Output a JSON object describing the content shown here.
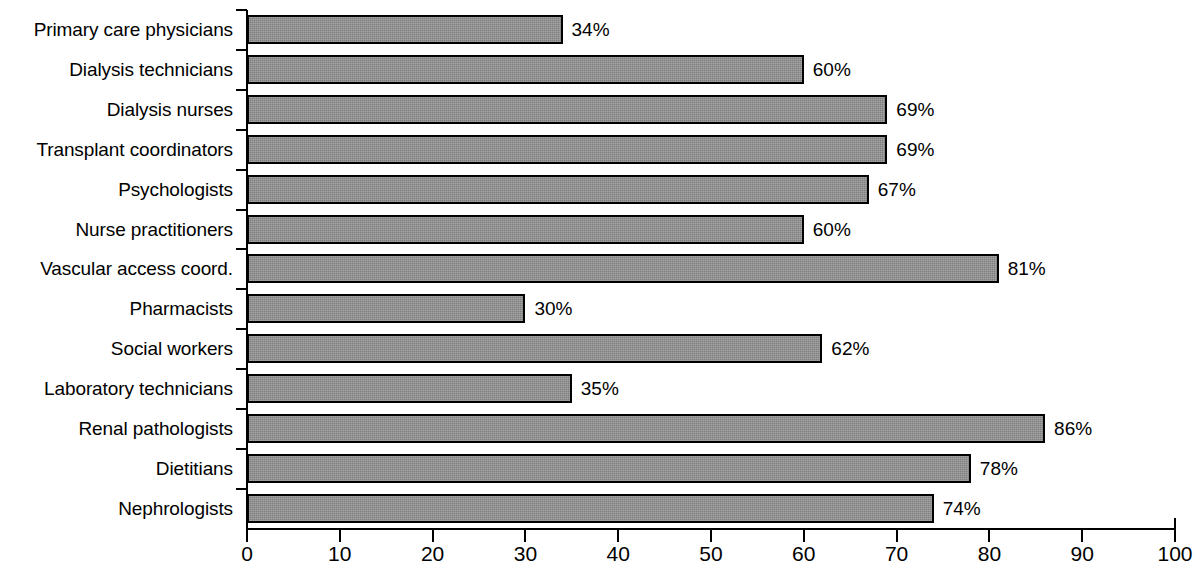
{
  "chart_data": {
    "type": "bar",
    "orientation": "horizontal",
    "title": "",
    "subtitle": "",
    "xlabel": "",
    "ylabel": "",
    "xlim": [
      0,
      100
    ],
    "xticks": [
      0,
      10,
      20,
      30,
      40,
      50,
      60,
      70,
      80,
      90,
      100
    ],
    "xtick_labels": [
      "0",
      "10",
      "20",
      "30",
      "40",
      "50",
      "60",
      "70",
      "80",
      "90",
      "100"
    ],
    "grid": false,
    "legend": null,
    "value_label_suffix": "%",
    "bar_color": "#7f7f7f",
    "bar_edge_color": "#000000",
    "categories": [
      "Primary care physicians",
      "Dialysis technicians",
      "Dialysis nurses",
      "Transplant coordinators",
      "Psychologists",
      "Nurse practitioners",
      "Vascular access coord.",
      "Pharmacists",
      "Social workers",
      "Laboratory technicians",
      "Renal pathologists",
      "Dietitians",
      "Nephrologists"
    ],
    "values": [
      34,
      60,
      69,
      69,
      67,
      60,
      81,
      30,
      62,
      35,
      86,
      78,
      74
    ],
    "value_labels": [
      "34%",
      "60%",
      "69%",
      "69%",
      "67%",
      "60%",
      "81%",
      "30%",
      "62%",
      "35%",
      "86%",
      "78%",
      "74%"
    ]
  }
}
